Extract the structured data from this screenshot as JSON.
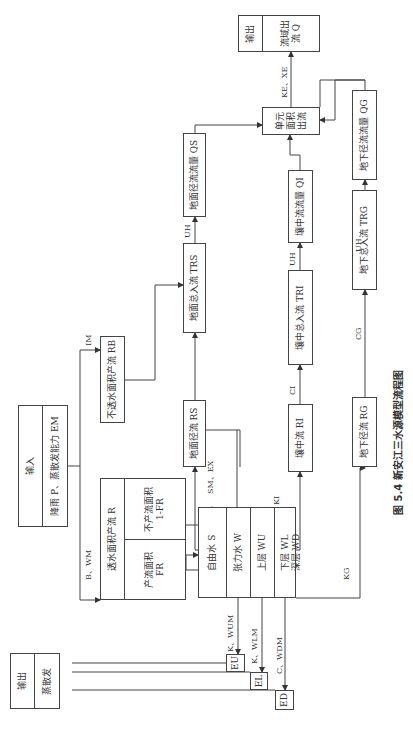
{
  "caption": "图 5.4   新安江三水源模型流程图",
  "input_box": {
    "title": "输入",
    "content": "降雨 P、蒸散发能力 EM"
  },
  "output_evap": {
    "title": "输出",
    "content": "蒸散发"
  },
  "output_basin": {
    "title": "输出",
    "content": "流域出流 Q"
  },
  "pervious_runoff": {
    "title": "透水面积产流 R",
    "non_runoff_area": "不产流面积 1-FR",
    "runoff_area": "产流面积 FR"
  },
  "impervious_runoff": "不透水面积产流 RB",
  "free_water": {
    "title": "自由水 S"
  },
  "tension_water": [
    "张力水 W",
    "上层 WU",
    "下层 WL",
    "深层 WD"
  ],
  "evap_components": [
    "EU",
    "EL",
    "ED"
  ],
  "boxes": {
    "rs": "地面径流 RS",
    "ri": "壤中流 RI",
    "rg": "地下径流 RG",
    "trs": "地面总入流 TRS",
    "tri": "壤中总入流 TRI",
    "trg": "地下总入流 TRG",
    "qs": "地面径流流量 QS",
    "qi": "壤中流流量 QI",
    "qg": "地下径流流量 QG",
    "unit_outflow": "单元面积出流"
  },
  "edge_labels": {
    "b_wm": "B、WM",
    "im": "IM",
    "sm_ex": "SM、EX",
    "ki": "KI",
    "kg": "KG",
    "ci": "CI",
    "cg": "CG",
    "uh_s": "UH",
    "uh_i": "UH",
    "uh_g": "UH",
    "ke_xe": "KE、XE",
    "k_wum": "K、WUM",
    "k_wlm": "K、WLM",
    "c_wdm": "C、WDM"
  }
}
